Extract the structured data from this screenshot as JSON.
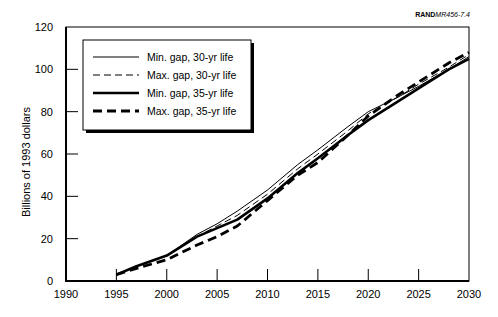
{
  "source_tag": {
    "bold": "RAND",
    "italic": "MR456-7.4"
  },
  "chart_data": {
    "type": "line",
    "title": "",
    "xlabel": "",
    "ylabel": "Billions of 1993 dollars",
    "xlim": [
      1990,
      2030
    ],
    "ylim": [
      0,
      120
    ],
    "x_ticks": [
      1990,
      1995,
      2000,
      2005,
      2010,
      2015,
      2020,
      2025,
      2030
    ],
    "y_ticks": [
      0,
      20,
      40,
      60,
      80,
      100,
      120
    ],
    "grid": false,
    "legend_position": "upper-left",
    "x": [
      1995,
      1997,
      2000,
      2003,
      2005,
      2007,
      2010,
      2013,
      2015,
      2018,
      2020,
      2023,
      2025,
      2028,
      2030
    ],
    "series": [
      {
        "name": "Min. gap, 30-yr life",
        "style": "thin-solid",
        "values": [
          3,
          7,
          12,
          22,
          27,
          33,
          43,
          55,
          62,
          73,
          80,
          87,
          92,
          100,
          106
        ]
      },
      {
        "name": "Max. gap, 30-yr life",
        "style": "thin-dashed",
        "values": [
          3,
          7,
          12,
          21,
          26,
          31,
          41,
          53,
          60,
          71,
          79,
          87,
          93,
          101,
          107
        ]
      },
      {
        "name": "Min. gap, 35-yr life",
        "style": "thick-solid",
        "values": [
          3,
          7,
          12,
          21,
          25,
          29,
          39,
          51,
          58,
          69,
          76,
          85,
          91,
          100,
          105
        ]
      },
      {
        "name": "Max. gap, 35-yr life",
        "style": "thick-dashed",
        "values": [
          3,
          6,
          10,
          17,
          21,
          26,
          38,
          50,
          56,
          69,
          78,
          88,
          94,
          103,
          108
        ]
      }
    ]
  }
}
